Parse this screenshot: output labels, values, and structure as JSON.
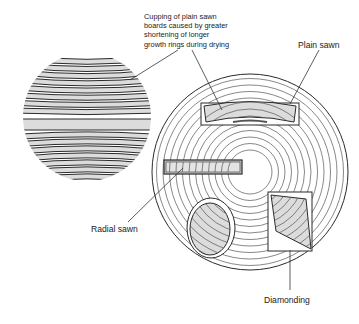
{
  "diagram": {
    "labels": {
      "cupping": [
        "Cupping of plain sawn",
        "boards caused by greater",
        "shortening of longer",
        "growth rings during drying"
      ],
      "plain_sawn": "Plain sawn",
      "radial_sawn": "Radial sawn",
      "diamonding": "Diamonding"
    },
    "colors": {
      "line": "#2a2a2a",
      "fill": "#dcdcdc",
      "ring": "#555555"
    },
    "sliced_log": {
      "center": [
        87,
        117
      ],
      "radius": 64
    },
    "log_section": {
      "center": [
        250,
        172
      ],
      "outer_radius": 98,
      "inner_radius": 22,
      "ring_count": 12
    }
  }
}
